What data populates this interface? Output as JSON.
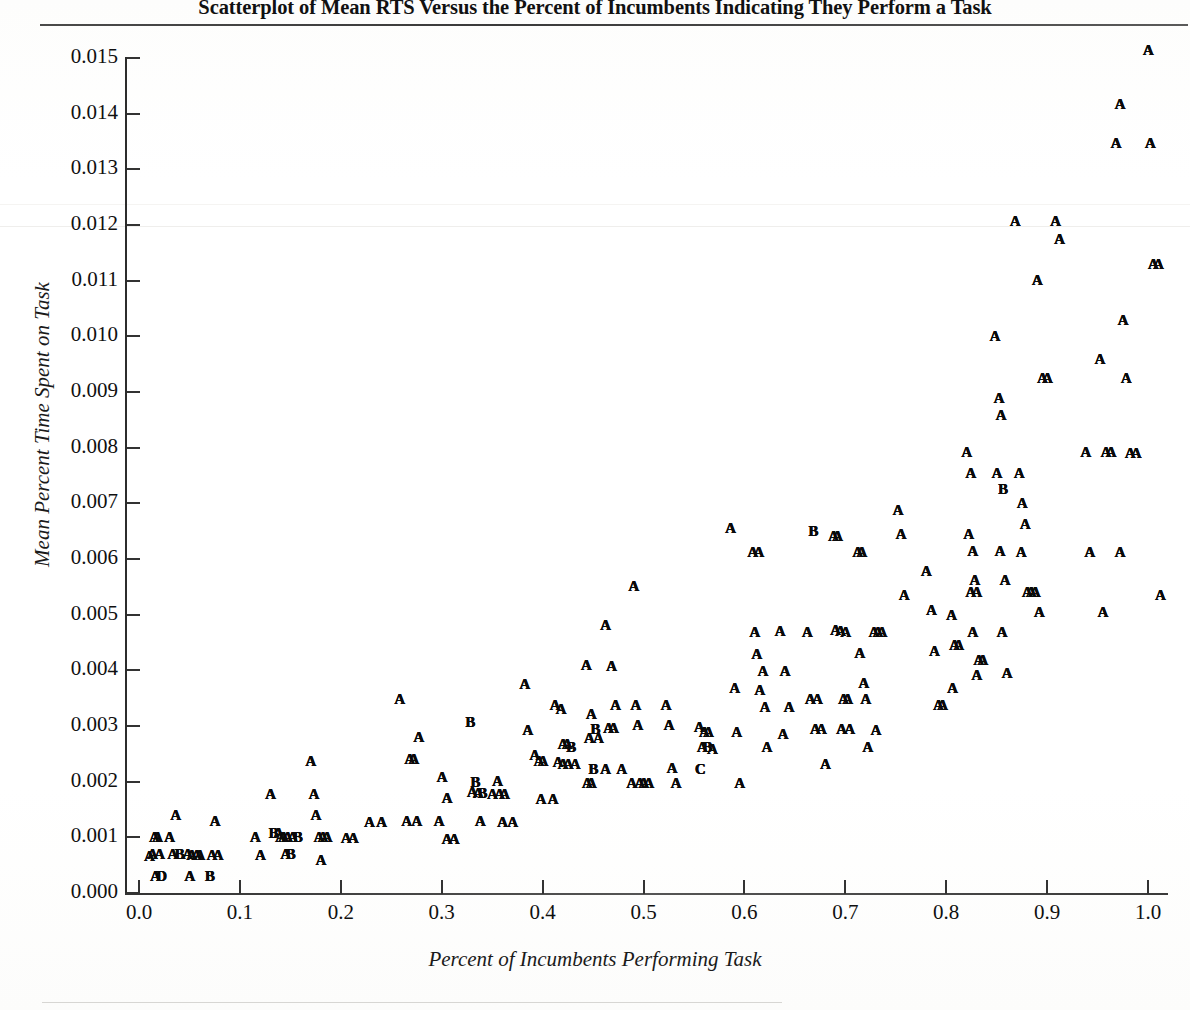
{
  "figure": {
    "title": "Scatterplot of Mean RTS Versus the Percent of Incumbents Indicating They Perform a Task"
  },
  "chart_data": {
    "type": "scatter",
    "title": "Scatterplot of Mean RTS Versus the Percent of Incumbents Indicating They Perform a Task",
    "xlabel": "Percent of Incumbents Performing Task",
    "ylabel": "Mean Percent Time Spent on Task",
    "xlim": [
      -0.02,
      1.04
    ],
    "ylim": [
      0.0,
      0.01545
    ],
    "grid": false,
    "legend": "none",
    "marker_note": "SAS letter plot symbols: A = 1 observation, B = 2, C = 3, D = 4 coincident points",
    "xticks": [
      "0.0",
      "0.1",
      "0.2",
      "0.3",
      "0.4",
      "0.5",
      "0.6",
      "0.7",
      "0.8",
      "0.9",
      "1.0"
    ],
    "xtick_values": [
      0.0,
      0.1,
      0.2,
      0.3,
      0.4,
      0.5,
      0.6,
      0.7,
      0.8,
      0.9,
      1.0
    ],
    "yticks": [
      "0.000",
      "0.001",
      "0.002",
      "0.003",
      "0.004",
      "0.005",
      "0.006",
      "0.007",
      "0.008",
      "0.009",
      "0.010",
      "0.011",
      "0.012",
      "0.013",
      "0.014",
      "0.015"
    ],
    "ytick_values": [
      0.0,
      0.001,
      0.002,
      0.003,
      0.004,
      0.005,
      0.006,
      0.007,
      0.008,
      0.009,
      0.01,
      0.011,
      0.012,
      0.013,
      0.014,
      0.015
    ],
    "points": [
      [
        0.01,
        0.00067,
        "A"
      ],
      [
        0.015,
        0.001,
        "A"
      ],
      [
        0.018,
        0.001,
        "A"
      ],
      [
        0.013,
        0.0007,
        "A"
      ],
      [
        0.02,
        0.0007,
        "A"
      ],
      [
        0.016,
        0.0003,
        "A"
      ],
      [
        0.022,
        0.0003,
        "D"
      ],
      [
        0.03,
        0.001,
        "A"
      ],
      [
        0.036,
        0.0014,
        "A"
      ],
      [
        0.033,
        0.0007,
        "A"
      ],
      [
        0.04,
        0.0007,
        "B"
      ],
      [
        0.048,
        0.0007,
        "A"
      ],
      [
        0.052,
        0.00068,
        "A"
      ],
      [
        0.057,
        0.00068,
        "A"
      ],
      [
        0.06,
        0.00068,
        "A"
      ],
      [
        0.05,
        0.0003,
        "A"
      ],
      [
        0.075,
        0.0013,
        "A"
      ],
      [
        0.072,
        0.00068,
        "A"
      ],
      [
        0.078,
        0.00068,
        "A"
      ],
      [
        0.07,
        0.0003,
        "B"
      ],
      [
        0.115,
        0.001,
        "A"
      ],
      [
        0.12,
        0.00068,
        "A"
      ],
      [
        0.13,
        0.00178,
        "A"
      ],
      [
        0.133,
        0.00108,
        "B"
      ],
      [
        0.138,
        0.00108,
        "A"
      ],
      [
        0.14,
        0.001,
        "A"
      ],
      [
        0.143,
        0.001,
        "A"
      ],
      [
        0.147,
        0.001,
        "A"
      ],
      [
        0.152,
        0.001,
        "A"
      ],
      [
        0.157,
        0.001,
        "B"
      ],
      [
        0.15,
        0.0007,
        "B"
      ],
      [
        0.145,
        0.0007,
        "A"
      ],
      [
        0.17,
        0.00238,
        "A"
      ],
      [
        0.173,
        0.00178,
        "A"
      ],
      [
        0.175,
        0.0014,
        "A"
      ],
      [
        0.178,
        0.001,
        "A"
      ],
      [
        0.182,
        0.001,
        "A"
      ],
      [
        0.186,
        0.001,
        "A"
      ],
      [
        0.18,
        0.0006,
        "A"
      ],
      [
        0.205,
        0.00098,
        "A"
      ],
      [
        0.212,
        0.00098,
        "A"
      ],
      [
        0.228,
        0.00128,
        "A"
      ],
      [
        0.24,
        0.00128,
        "A"
      ],
      [
        0.258,
        0.00348,
        "A"
      ],
      [
        0.268,
        0.0024,
        "A"
      ],
      [
        0.272,
        0.0024,
        "A"
      ],
      [
        0.277,
        0.0028,
        "A"
      ],
      [
        0.265,
        0.0013,
        "A"
      ],
      [
        0.275,
        0.0013,
        "A"
      ],
      [
        0.3,
        0.00208,
        "A"
      ],
      [
        0.305,
        0.0017,
        "A"
      ],
      [
        0.297,
        0.0013,
        "A"
      ],
      [
        0.305,
        0.00097,
        "A"
      ],
      [
        0.312,
        0.00097,
        "A"
      ],
      [
        0.328,
        0.00308,
        "B"
      ],
      [
        0.333,
        0.002,
        "B"
      ],
      [
        0.33,
        0.00182,
        "A"
      ],
      [
        0.336,
        0.0018,
        "A"
      ],
      [
        0.34,
        0.0018,
        "B"
      ],
      [
        0.338,
        0.0013,
        "A"
      ],
      [
        0.355,
        0.00202,
        "A"
      ],
      [
        0.35,
        0.00178,
        "A"
      ],
      [
        0.357,
        0.00178,
        "A"
      ],
      [
        0.362,
        0.00178,
        "A"
      ],
      [
        0.36,
        0.00128,
        "A"
      ],
      [
        0.37,
        0.00128,
        "A"
      ],
      [
        0.382,
        0.00375,
        "A"
      ],
      [
        0.385,
        0.00292,
        "A"
      ],
      [
        0.392,
        0.00248,
        "A"
      ],
      [
        0.396,
        0.00238,
        "A"
      ],
      [
        0.4,
        0.00238,
        "A"
      ],
      [
        0.398,
        0.00168,
        "A"
      ],
      [
        0.412,
        0.00338,
        "A"
      ],
      [
        0.418,
        0.0033,
        "A"
      ],
      [
        0.42,
        0.00268,
        "A"
      ],
      [
        0.424,
        0.00268,
        "A"
      ],
      [
        0.428,
        0.00262,
        "B"
      ],
      [
        0.415,
        0.00235,
        "A"
      ],
      [
        0.42,
        0.00232,
        "A"
      ],
      [
        0.425,
        0.00232,
        "A"
      ],
      [
        0.432,
        0.00232,
        "A"
      ],
      [
        0.41,
        0.00168,
        "A"
      ],
      [
        0.443,
        0.0041,
        "A"
      ],
      [
        0.448,
        0.00322,
        "A"
      ],
      [
        0.452,
        0.00295,
        "B"
      ],
      [
        0.446,
        0.00278,
        "A"
      ],
      [
        0.455,
        0.00278,
        "A"
      ],
      [
        0.45,
        0.00222,
        "B"
      ],
      [
        0.444,
        0.00198,
        "A"
      ],
      [
        0.448,
        0.00198,
        "A"
      ],
      [
        0.462,
        0.00482,
        "A"
      ],
      [
        0.468,
        0.00408,
        "A"
      ],
      [
        0.472,
        0.00338,
        "A"
      ],
      [
        0.465,
        0.00296,
        "A"
      ],
      [
        0.47,
        0.00296,
        "A"
      ],
      [
        0.462,
        0.00222,
        "A"
      ],
      [
        0.478,
        0.00222,
        "A"
      ],
      [
        0.49,
        0.00552,
        "A"
      ],
      [
        0.492,
        0.00338,
        "A"
      ],
      [
        0.494,
        0.00302,
        "A"
      ],
      [
        0.488,
        0.00198,
        "A"
      ],
      [
        0.496,
        0.00198,
        "A"
      ],
      [
        0.5,
        0.00198,
        "A"
      ],
      [
        0.505,
        0.00198,
        "A"
      ],
      [
        0.522,
        0.00338,
        "A"
      ],
      [
        0.525,
        0.00302,
        "A"
      ],
      [
        0.528,
        0.00225,
        "A"
      ],
      [
        0.532,
        0.00198,
        "A"
      ],
      [
        0.555,
        0.00298,
        "A"
      ],
      [
        0.56,
        0.0029,
        "A"
      ],
      [
        0.564,
        0.0029,
        "A"
      ],
      [
        0.558,
        0.00262,
        "A"
      ],
      [
        0.563,
        0.00262,
        "B"
      ],
      [
        0.568,
        0.00258,
        "A"
      ],
      [
        0.556,
        0.00222,
        "C"
      ],
      [
        0.586,
        0.00655,
        "A"
      ],
      [
        0.59,
        0.00368,
        "A"
      ],
      [
        0.592,
        0.0029,
        "A"
      ],
      [
        0.595,
        0.00198,
        "A"
      ],
      [
        0.608,
        0.00612,
        "A"
      ],
      [
        0.614,
        0.00612,
        "A"
      ],
      [
        0.61,
        0.00468,
        "A"
      ],
      [
        0.612,
        0.0043,
        "A"
      ],
      [
        0.615,
        0.00365,
        "A"
      ],
      [
        0.62,
        0.00335,
        "A"
      ],
      [
        0.618,
        0.00398,
        "A"
      ],
      [
        0.622,
        0.00262,
        "A"
      ],
      [
        0.635,
        0.0047,
        "A"
      ],
      [
        0.64,
        0.00398,
        "A"
      ],
      [
        0.644,
        0.00335,
        "A"
      ],
      [
        0.638,
        0.00285,
        "A"
      ],
      [
        0.662,
        0.00468,
        "A"
      ],
      [
        0.665,
        0.00348,
        "A"
      ],
      [
        0.668,
        0.0065,
        "B"
      ],
      [
        0.672,
        0.00348,
        "A"
      ],
      [
        0.67,
        0.00295,
        "A"
      ],
      [
        0.676,
        0.00295,
        "A"
      ],
      [
        0.68,
        0.00232,
        "A"
      ],
      [
        0.688,
        0.00642,
        "A"
      ],
      [
        0.692,
        0.00642,
        "A"
      ],
      [
        0.69,
        0.00472,
        "A"
      ],
      [
        0.695,
        0.0047,
        "A"
      ],
      [
        0.7,
        0.00468,
        "A"
      ],
      [
        0.698,
        0.00348,
        "A"
      ],
      [
        0.702,
        0.00348,
        "A"
      ],
      [
        0.696,
        0.00295,
        "A"
      ],
      [
        0.704,
        0.00295,
        "A"
      ],
      [
        0.712,
        0.00612,
        "A"
      ],
      [
        0.716,
        0.00612,
        "A"
      ],
      [
        0.714,
        0.00432,
        "A"
      ],
      [
        0.718,
        0.00378,
        "A"
      ],
      [
        0.72,
        0.00348,
        "A"
      ],
      [
        0.722,
        0.00262,
        "A"
      ],
      [
        0.728,
        0.00468,
        "A"
      ],
      [
        0.732,
        0.00468,
        "A"
      ],
      [
        0.736,
        0.00468,
        "A"
      ],
      [
        0.73,
        0.00292,
        "A"
      ],
      [
        0.752,
        0.00688,
        "A"
      ],
      [
        0.755,
        0.00645,
        "A"
      ],
      [
        0.758,
        0.00535,
        "A"
      ],
      [
        0.78,
        0.00578,
        "A"
      ],
      [
        0.785,
        0.00508,
        "A"
      ],
      [
        0.788,
        0.00435,
        "A"
      ],
      [
        0.792,
        0.00338,
        "A"
      ],
      [
        0.796,
        0.00338,
        "A"
      ],
      [
        0.805,
        0.005,
        "A"
      ],
      [
        0.808,
        0.00445,
        "A"
      ],
      [
        0.812,
        0.00445,
        "A"
      ],
      [
        0.806,
        0.00368,
        "A"
      ],
      [
        0.82,
        0.00792,
        "A"
      ],
      [
        0.824,
        0.00755,
        "A"
      ],
      [
        0.822,
        0.00645,
        "A"
      ],
      [
        0.826,
        0.00615,
        "A"
      ],
      [
        0.828,
        0.00562,
        "A"
      ],
      [
        0.824,
        0.0054,
        "A"
      ],
      [
        0.83,
        0.0054,
        "A"
      ],
      [
        0.826,
        0.00468,
        "A"
      ],
      [
        0.832,
        0.00418,
        "A"
      ],
      [
        0.836,
        0.00418,
        "A"
      ],
      [
        0.83,
        0.00392,
        "A"
      ],
      [
        0.848,
        0.01,
        "A"
      ],
      [
        0.852,
        0.0089,
        "A"
      ],
      [
        0.854,
        0.00858,
        "A"
      ],
      [
        0.85,
        0.00755,
        "A"
      ],
      [
        0.856,
        0.00725,
        "B"
      ],
      [
        0.853,
        0.00615,
        "A"
      ],
      [
        0.858,
        0.00562,
        "A"
      ],
      [
        0.855,
        0.00468,
        "A"
      ],
      [
        0.86,
        0.00395,
        "A"
      ],
      [
        0.868,
        0.01208,
        "A"
      ],
      [
        0.872,
        0.00755,
        "A"
      ],
      [
        0.875,
        0.007,
        "A"
      ],
      [
        0.878,
        0.00662,
        "A"
      ],
      [
        0.874,
        0.00612,
        "A"
      ],
      [
        0.88,
        0.0054,
        "A"
      ],
      [
        0.884,
        0.0054,
        "A"
      ],
      [
        0.89,
        0.01102,
        "A"
      ],
      [
        0.895,
        0.00925,
        "A"
      ],
      [
        0.9,
        0.00925,
        "A"
      ],
      [
        0.888,
        0.0054,
        "A"
      ],
      [
        0.892,
        0.00505,
        "A"
      ],
      [
        0.908,
        0.01208,
        "A"
      ],
      [
        0.912,
        0.01175,
        "A"
      ],
      [
        0.938,
        0.00792,
        "A"
      ],
      [
        0.942,
        0.00612,
        "A"
      ],
      [
        0.952,
        0.0096,
        "A"
      ],
      [
        0.958,
        0.00792,
        "A"
      ],
      [
        0.963,
        0.00792,
        "A"
      ],
      [
        0.955,
        0.00505,
        "A"
      ],
      [
        0.968,
        0.01348,
        "A"
      ],
      [
        0.972,
        0.01418,
        "A"
      ],
      [
        0.975,
        0.0103,
        "A"
      ],
      [
        0.978,
        0.00925,
        "A"
      ],
      [
        0.972,
        0.00612,
        "A"
      ],
      [
        0.982,
        0.0079,
        "A"
      ],
      [
        0.988,
        0.0079,
        "A"
      ],
      [
        1.0,
        0.01515,
        "A"
      ],
      [
        1.002,
        0.01348,
        "A"
      ],
      [
        1.005,
        0.0113,
        "A"
      ],
      [
        1.01,
        0.0113,
        "A"
      ],
      [
        1.012,
        0.00535,
        "A"
      ]
    ]
  }
}
